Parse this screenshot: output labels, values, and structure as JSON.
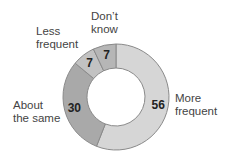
{
  "chart_data": {
    "type": "pie",
    "donut": true,
    "title": "",
    "categories": [
      "More frequent",
      "About the same",
      "Less frequent",
      "Don't know"
    ],
    "values": [
      56,
      30,
      7,
      7
    ],
    "colors": [
      "#d6d6d6",
      "#a9a9a9",
      "#c2c2c2",
      "#b6b6b6"
    ],
    "value_labels": [
      "56",
      "30",
      "7",
      "7"
    ]
  },
  "labels": {
    "more": [
      "More",
      "frequent"
    ],
    "same": [
      "About",
      "the same"
    ],
    "less": [
      "Less",
      "frequent"
    ],
    "dk": [
      "Don’t",
      "know"
    ]
  }
}
